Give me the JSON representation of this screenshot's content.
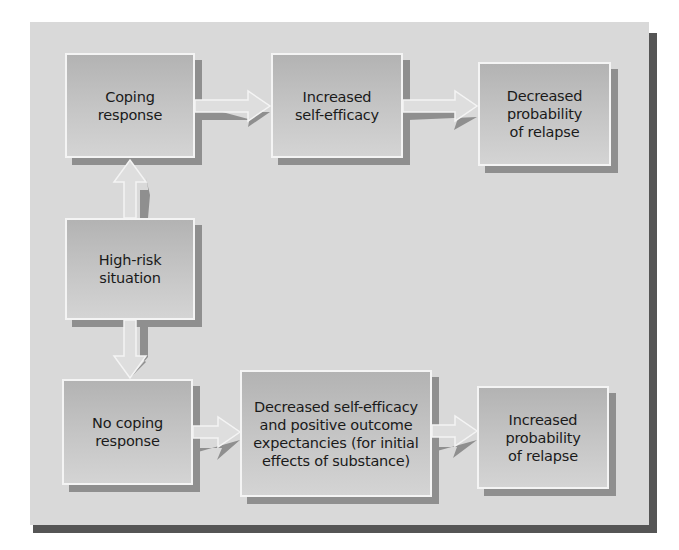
{
  "diagram": {
    "title": "",
    "nodes": [
      {
        "id": "coping",
        "label": "Coping\nresponse"
      },
      {
        "id": "inc_self_efficacy",
        "label": "Increased\nself-efficacy"
      },
      {
        "id": "dec_prob_relapse",
        "label": "Decreased\nprobability\nof relapse"
      },
      {
        "id": "high_risk",
        "label": "High-risk\nsituation"
      },
      {
        "id": "no_coping",
        "label": "No coping\nresponse"
      },
      {
        "id": "dec_self_efficacy",
        "label": "Decreased self-efficacy\nand positive outcome\nexpectancies (for initial\neffects of substance)"
      },
      {
        "id": "inc_prob_relapse",
        "label": "Increased\nprobability\nof relapse"
      }
    ],
    "edges": [
      {
        "from": "high_risk",
        "to": "coping"
      },
      {
        "from": "high_risk",
        "to": "no_coping"
      },
      {
        "from": "coping",
        "to": "inc_self_efficacy"
      },
      {
        "from": "inc_self_efficacy",
        "to": "dec_prob_relapse"
      },
      {
        "from": "no_coping",
        "to": "dec_self_efficacy"
      },
      {
        "from": "dec_self_efficacy",
        "to": "inc_prob_relapse"
      }
    ],
    "colors": {
      "panel": "#d9d9d9",
      "panel_shadow": "#555555",
      "box_fill": "#bdbdbd",
      "box_border": "#f4f4f4",
      "box_shadow": "#8f8f8f",
      "arrow_fill": "#dedede",
      "arrow_shadow": "#8f8f8f"
    }
  }
}
